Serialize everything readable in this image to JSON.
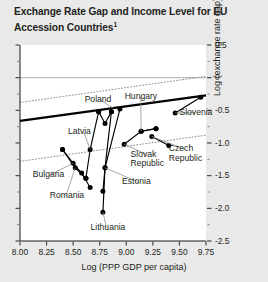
{
  "figure": {
    "title_text": "Exchange Rate Gap and Income Level for EU Accession Countries",
    "title_footnote_marker": "1",
    "background_color": "#e9e9e9",
    "plot_background_color": "#ffffff"
  },
  "chart_data": {
    "type": "scatter",
    "title": "Exchange Rate Gap and Income Level for EU Accession Countries1",
    "xlabel": "Log (PPP GDP per capita)",
    "ylabel": "Log (exchange rate gap)",
    "xlim": [
      8.0,
      9.75
    ],
    "ylim": [
      -2.5,
      0.5
    ],
    "xticks": [
      "8.00",
      "8.25",
      "8.50",
      "8.75",
      "9.00",
      "9.25",
      "9.50",
      "9.75"
    ],
    "xtick_values": [
      8.0,
      8.25,
      8.5,
      8.75,
      9.0,
      9.25,
      9.5,
      9.75
    ],
    "yticks": [
      "0.5",
      "0",
      "-0.5",
      "-1.0",
      "-1.5",
      "-2.0",
      "-2.5"
    ],
    "ytick_values": [
      0.5,
      0,
      -0.5,
      -1.0,
      -1.5,
      -2.0,
      -2.5
    ],
    "minor_ticks": true,
    "grid": false,
    "legend": "none",
    "zero_reference_line": 0,
    "regression_line": {
      "name": "fitted regression line",
      "style": "solid-thick",
      "color": "#000000",
      "x": [
        8.0,
        9.75
      ],
      "y": [
        -0.66,
        -0.27
      ]
    },
    "confidence_bands": [
      {
        "name": "upper confidence band",
        "style": "dotted",
        "color": "#9a9a9a",
        "x": [
          8.0,
          9.75
        ],
        "y": [
          -0.38,
          0.02
        ]
      },
      {
        "name": "lower confidence band",
        "style": "dotted",
        "color": "#9a9a9a",
        "x": [
          8.0,
          9.75
        ],
        "y": [
          -1.28,
          -0.88
        ]
      }
    ],
    "series": [
      {
        "name": "Bulgaria",
        "label": "Bulgaria",
        "points": [
          {
            "x": 8.4,
            "y": -1.1
          },
          {
            "x": 8.5,
            "y": -1.31
          },
          {
            "x": 8.58,
            "y": -1.46
          },
          {
            "x": 8.66,
            "y": -1.68
          }
        ]
      },
      {
        "name": "Romania",
        "label": "Romania",
        "points": [
          {
            "x": 8.4,
            "y": -1.1
          },
          {
            "x": 8.52,
            "y": -1.38
          },
          {
            "x": 8.62,
            "y": -1.54
          }
        ]
      },
      {
        "name": "Latvia",
        "label": "Latvia",
        "points": [
          {
            "x": 8.74,
            "y": -0.52
          },
          {
            "x": 8.66,
            "y": -1.1
          },
          {
            "x": 8.62,
            "y": -1.54
          }
        ]
      },
      {
        "name": "Poland",
        "label": "Poland",
        "points": [
          {
            "x": 8.86,
            "y": -0.52
          },
          {
            "x": 8.8,
            "y": -0.7
          },
          {
            "x": 8.74,
            "y": -0.52
          }
        ]
      },
      {
        "name": "Estonia",
        "label": "Estonia",
        "points": [
          {
            "x": 8.86,
            "y": -0.52
          },
          {
            "x": 8.8,
            "y": -1.38
          },
          {
            "x": 8.78,
            "y": -1.74
          }
        ]
      },
      {
        "name": "Lithuania",
        "label": "Lithuania",
        "points": [
          {
            "x": 8.94,
            "y": -0.48
          },
          {
            "x": 8.8,
            "y": -1.38
          },
          {
            "x": 8.78,
            "y": -2.06
          }
        ]
      },
      {
        "name": "Slovak Republic",
        "label": "Slovak Republic",
        "points": [
          {
            "x": 8.98,
            "y": -1.02
          },
          {
            "x": 9.14,
            "y": -0.82
          },
          {
            "x": 9.28,
            "y": -0.78
          }
        ]
      },
      {
        "name": "Hungary",
        "label": "Hungary",
        "points": [
          {
            "x": 9.14,
            "y": -0.82
          },
          {
            "x": 9.28,
            "y": -0.78
          }
        ]
      },
      {
        "name": "Czech Republic",
        "label": "Czech Republic",
        "points": [
          {
            "x": 9.24,
            "y": -0.9
          },
          {
            "x": 9.4,
            "y": -1.04
          }
        ]
      },
      {
        "name": "Slovenia",
        "label": "Slovenia",
        "points": [
          {
            "x": 9.46,
            "y": -0.54
          },
          {
            "x": 9.7,
            "y": -0.3
          }
        ]
      }
    ],
    "point_labels": [
      {
        "label": "Poland",
        "x": 8.74,
        "y": -0.3
      },
      {
        "label": "Latvia",
        "x": 8.47,
        "y": -0.76
      },
      {
        "label": "Bulgaria",
        "x": 8.12,
        "y": -1.42
      },
      {
        "label": "Romania",
        "x": 8.28,
        "y": -1.74
      },
      {
        "label": "Lithuania",
        "x": 8.72,
        "y": -2.22
      },
      {
        "label": "Estonia",
        "x": 8.96,
        "y": -1.52
      },
      {
        "label": "Hungary",
        "x": 9.06,
        "y": -0.22
      },
      {
        "label": "Slovak Republic",
        "x": 9.04,
        "y": -1.1
      },
      {
        "label": "Czech Republic",
        "x": 9.4,
        "y": -1.02
      },
      {
        "label": "Slovenia",
        "x": 9.5,
        "y": -0.46
      }
    ]
  },
  "axes": {
    "x_title": "Log (PPP GDP per capita)",
    "y_title": "Log (exchange rate gap)",
    "x_tick_labels": [
      "8.00",
      "8.25",
      "8.50",
      "8.75",
      "9.00",
      "9.25",
      "9.50",
      "9.75"
    ],
    "y_tick_labels": [
      "0.5",
      "0",
      "-0.5",
      "-1.0",
      "-1.5",
      "-2.0",
      "-2.5"
    ]
  },
  "point_label_text": {
    "poland": "Poland",
    "latvia": "Latvia",
    "bulgaria": "Bulgaria",
    "romania": "Romania",
    "lithuania": "Lithuania",
    "estonia": "Estonia",
    "hungary": "Hungary",
    "slovak_republic_line1": "Slovak",
    "slovak_republic_line2": "Republic",
    "czech_republic_line1": "Czech",
    "czech_republic_line2": "Republic",
    "slovenia": "Slovenia"
  }
}
